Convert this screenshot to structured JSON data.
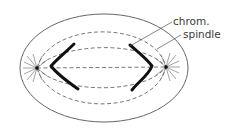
{
  "diagram": {
    "labels": {
      "chromosome": "chrom.",
      "spindle": "spindle"
    },
    "colors": {
      "background": "#ffffff",
      "outline": "#555555",
      "chromosome": "#111111",
      "label_text": "#3a3a3a"
    },
    "elements": [
      {
        "name": "cell-membrane",
        "type": "ellipse"
      },
      {
        "name": "spindle-fibers",
        "type": "dashed-curves"
      },
      {
        "name": "left-pole",
        "type": "centrosome-with-asters"
      },
      {
        "name": "right-pole",
        "type": "centrosome-with-asters"
      },
      {
        "name": "left-chromosome",
        "type": "v-shaped-chromosome"
      },
      {
        "name": "right-chromosome",
        "type": "v-shaped-chromosome"
      }
    ]
  }
}
